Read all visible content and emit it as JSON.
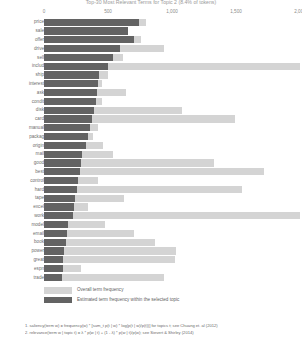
{
  "chart_data": {
    "type": "bar",
    "orientation": "horizontal",
    "title": "Top-30 Most Relevant Terms for Topic 2 (8.4% of tokens)",
    "xlabel": "",
    "ylabel": "",
    "xlim": [
      0,
      2000
    ],
    "grid": false,
    "legend_position": "bottom-left",
    "tick_labels": [
      "0",
      "500",
      "1,000",
      "1,500",
      "2,000"
    ],
    "tick_values": [
      0,
      500,
      1000,
      1500,
      2000
    ],
    "categories": [
      "price",
      "sale",
      "offer",
      "drive",
      "sell",
      "includ",
      "ship",
      "interest",
      "ask",
      "condit",
      "disk",
      "card",
      "manual",
      "packag",
      "origin",
      "mail",
      "good",
      "best",
      "control",
      "hard",
      "tape",
      "excel",
      "work",
      "model",
      "email",
      "book",
      "power",
      "great",
      "espn",
      "trade"
    ],
    "series": [
      {
        "name": "Overall term frequency",
        "color": "#d4d4d4",
        "values": [
          800,
          660,
          760,
          940,
          620,
          2000,
          500,
          455,
          640,
          455,
          1080,
          1490,
          425,
          380,
          460,
          540,
          1330,
          1720,
          420,
          1545,
          625,
          340,
          2310,
          480,
          700,
          870,
          1030,
          1020,
          290,
          935
        ]
      },
      {
        "name": "Estimated term frequency within the selected topic",
        "color": "#636363",
        "values": [
          740,
          660,
          700,
          590,
          540,
          500,
          430,
          420,
          415,
          405,
          390,
          375,
          360,
          345,
          330,
          300,
          290,
          280,
          265,
          255,
          245,
          235,
          225,
          185,
          178,
          170,
          160,
          152,
          145,
          140
        ]
      }
    ]
  },
  "legend": {
    "items": [
      {
        "label": "Overall term frequency",
        "swatch": "overall"
      },
      {
        "label": "Estimated term frequency within the selected topic",
        "swatch": "topic"
      }
    ]
  },
  "footnotes": [
    "1. saliency(term w) = frequency(w) * [sum_t p(t | w) * log(p(t | w)/p(t))] for topics t; see Chuang et. al (2012)",
    "2. relevance(term w | topic t) = λ * p(w | t) + (1 - λ) * p(w | t)/p(w); see Sievert & Shirley (2014)"
  ]
}
